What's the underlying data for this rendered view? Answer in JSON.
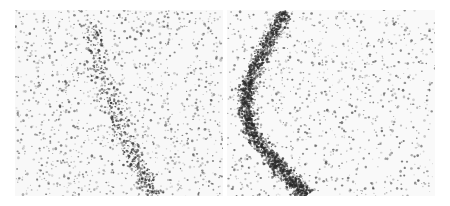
{
  "figure": {
    "background": "#ffffff",
    "panels": [
      {
        "id": "left",
        "x": 15,
        "y": 10,
        "width": 208,
        "height": 186,
        "base_color": "#f8f8f8",
        "dot_color": "#3a3a3a",
        "sparse_count": 1400,
        "band": {
          "points": [
            [
              75,
              10
            ],
            [
              85,
              60
            ],
            [
              100,
              110
            ],
            [
              120,
              150
            ],
            [
              140,
              186
            ]
          ],
          "width": 30,
          "count": 500,
          "color": "#333333"
        }
      },
      {
        "id": "right",
        "x": 227,
        "y": 10,
        "width": 208,
        "height": 186,
        "base_color": "#f9f9f9",
        "dot_color": "#3a3a3a",
        "sparse_count": 1100,
        "band": {
          "points": [
            [
              58,
              2
            ],
            [
              40,
              35
            ],
            [
              22,
              70
            ],
            [
              18,
              95
            ],
            [
              25,
              125
            ],
            [
              45,
              150
            ],
            [
              65,
              170
            ],
            [
              80,
              186
            ]
          ],
          "width": 24,
          "count": 2200,
          "color": "#2a2a2a"
        }
      }
    ]
  }
}
